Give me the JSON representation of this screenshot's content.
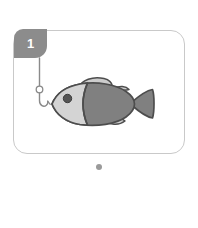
{
  "page": {
    "background_color": "#ffffff",
    "width": 198,
    "height": 228
  },
  "card": {
    "border_color": "#c9c9c9",
    "background_color": "#ffffff",
    "corner_radius": 14
  },
  "badge": {
    "label": "1",
    "background_color": "#8c8c8c",
    "text_color": "#ffffff"
  },
  "illustration": {
    "name": "fish-and-hook-illustration",
    "description": "A gray cartoon fish facing left toward a fishing hook hanging from a line",
    "colors": {
      "outline": "#4d4d4d",
      "body": "#808080",
      "head": "#d4d4d4",
      "fin": "#cccccc",
      "eye": "#555555",
      "line": "#8a8a8a"
    },
    "parts": [
      {
        "name": "fishing-line",
        "label": "Fishing line"
      },
      {
        "name": "hook-eye",
        "label": "Hook eye"
      },
      {
        "name": "fish-hook",
        "label": "Fish hook"
      },
      {
        "name": "fish-body",
        "label": "Fish body"
      },
      {
        "name": "fish-head",
        "label": "Fish head"
      },
      {
        "name": "fish-eye",
        "label": "Fish eye"
      },
      {
        "name": "dorsal-fin",
        "label": "Dorsal fin"
      },
      {
        "name": "second-dorsal-fin",
        "label": "Second dorsal fin"
      },
      {
        "name": "pelvic-fin",
        "label": "Pelvic fin"
      },
      {
        "name": "tail-fin",
        "label": "Tail fin"
      }
    ]
  },
  "pager": {
    "total": 1,
    "active_index": 0,
    "active_color": "#9a9a9a",
    "inactive_color": "#d8d8d8"
  }
}
